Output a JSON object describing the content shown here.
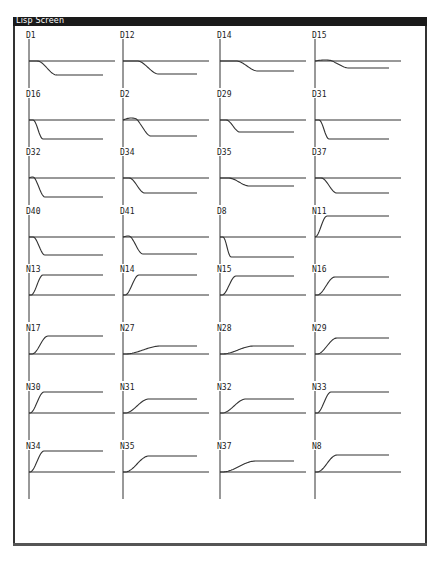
{
  "window": {
    "title": "Lisp Screen"
  },
  "layout": {
    "columns_x": [
      29,
      123,
      220,
      315
    ],
    "rows_y": [
      32,
      91,
      149,
      208,
      266,
      325,
      384,
      443
    ],
    "axis_height": 49,
    "baseline_offset": 29,
    "axis_top_offset": 7,
    "hline_length": 86,
    "curve_length": 74
  },
  "chart_data": {
    "type": "line",
    "title": "Lisp Screen",
    "grid": {
      "rows": 8,
      "cols": 4
    },
    "panels": [
      {
        "label": "D1",
        "onset": 8,
        "width": 20,
        "amp": -14,
        "bump": 0
      },
      {
        "label": "D12",
        "onset": 14,
        "width": 22,
        "amp": -13,
        "bump": 0
      },
      {
        "label": "D14",
        "onset": 16,
        "width": 22,
        "amp": -10,
        "bump": 0
      },
      {
        "label": "D15",
        "onset": 14,
        "width": 20,
        "amp": -7,
        "bump": 1
      },
      {
        "label": "D16",
        "onset": 4,
        "width": 10,
        "amp": -19,
        "bump": 0
      },
      {
        "label": "D2",
        "onset": 12,
        "width": 16,
        "amp": -16,
        "bump": 2
      },
      {
        "label": "D29",
        "onset": 6,
        "width": 14,
        "amp": -12,
        "bump": 0
      },
      {
        "label": "D31",
        "onset": 4,
        "width": 10,
        "amp": -19,
        "bump": 0
      },
      {
        "label": "D32",
        "onset": 4,
        "width": 12,
        "amp": -19,
        "bump": 1
      },
      {
        "label": "D34",
        "onset": 6,
        "width": 16,
        "amp": -15,
        "bump": 0
      },
      {
        "label": "D35",
        "onset": 8,
        "width": 22,
        "amp": -8,
        "bump": 0
      },
      {
        "label": "D37",
        "onset": 6,
        "width": 16,
        "amp": -15,
        "bump": 0
      },
      {
        "label": "D40",
        "onset": 4,
        "width": 12,
        "amp": -18,
        "bump": 0
      },
      {
        "label": "D41",
        "onset": 6,
        "width": 14,
        "amp": -17,
        "bump": 1
      },
      {
        "label": "D8",
        "onset": 3,
        "width": 8,
        "amp": -20,
        "bump": 0
      },
      {
        "label": "N11",
        "onset": 0,
        "width": 12,
        "amp": 21,
        "bump": 0
      },
      {
        "label": "N13",
        "onset": 2,
        "width": 12,
        "amp": 20,
        "bump": 0
      },
      {
        "label": "N14",
        "onset": 2,
        "width": 14,
        "amp": 20,
        "bump": 0
      },
      {
        "label": "N15",
        "onset": 2,
        "width": 14,
        "amp": 19,
        "bump": 0
      },
      {
        "label": "N16",
        "onset": 2,
        "width": 18,
        "amp": 18,
        "bump": 0
      },
      {
        "label": "N17",
        "onset": 3,
        "width": 16,
        "amp": 18,
        "bump": 0
      },
      {
        "label": "N27",
        "onset": 2,
        "width": 36,
        "amp": 8,
        "bump": 0
      },
      {
        "label": "N28",
        "onset": 2,
        "width": 32,
        "amp": 8,
        "bump": 0
      },
      {
        "label": "N29",
        "onset": 2,
        "width": 20,
        "amp": 16,
        "bump": 0
      },
      {
        "label": "N30",
        "onset": 1,
        "width": 14,
        "amp": 21,
        "bump": 0
      },
      {
        "label": "N31",
        "onset": 2,
        "width": 24,
        "amp": 14,
        "bump": 0
      },
      {
        "label": "N32",
        "onset": 2,
        "width": 24,
        "amp": 14,
        "bump": 0
      },
      {
        "label": "N33",
        "onset": 2,
        "width": 14,
        "amp": 21,
        "bump": 0
      },
      {
        "label": "N34",
        "onset": 1,
        "width": 14,
        "amp": 21,
        "bump": 0
      },
      {
        "label": "N35",
        "onset": 2,
        "width": 24,
        "amp": 16,
        "bump": 0
      },
      {
        "label": "N37",
        "onset": 2,
        "width": 34,
        "amp": 11,
        "bump": 0
      },
      {
        "label": "N8",
        "onset": 2,
        "width": 20,
        "amp": 17,
        "bump": 0
      }
    ]
  },
  "colors": {
    "titlebar": "#1a1a1a",
    "title_text": "#ffffff",
    "line": "#333333",
    "background": "#ffffff"
  }
}
